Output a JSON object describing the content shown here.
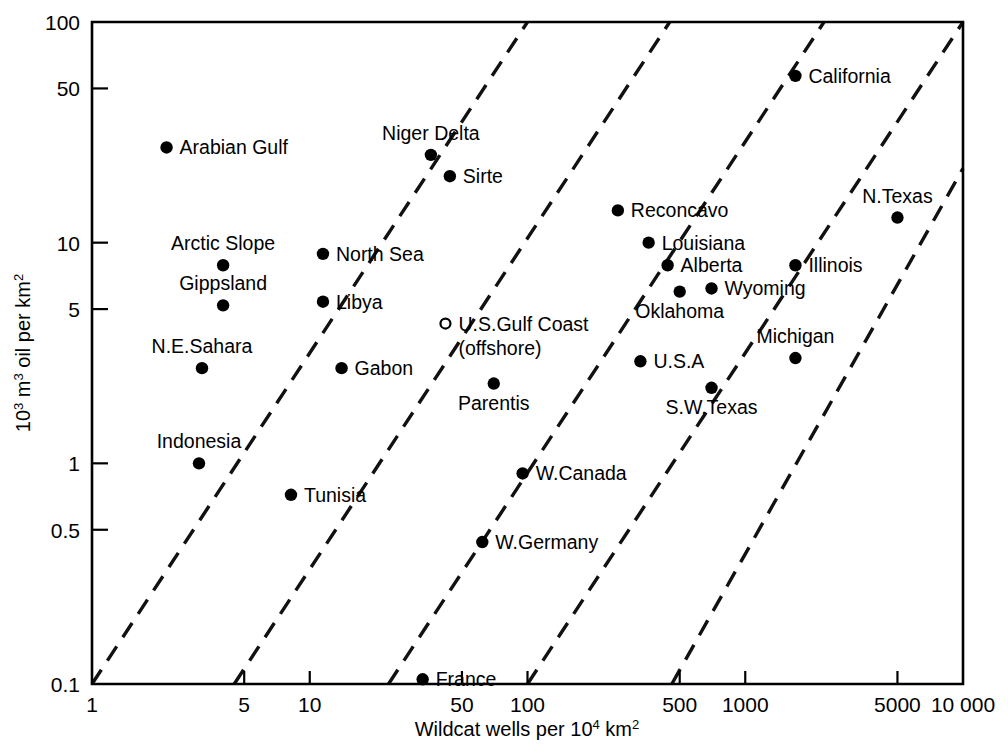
{
  "chart_data": {
    "type": "scatter",
    "title": "",
    "xlabel": "Wildcat wells per 10⁴ km²",
    "ylabel": "10³ m³ oil per km²",
    "xlabel_parts": {
      "pre": "Wildcat wells per 10",
      "exp": "4",
      "post": " km",
      "exp2": "2"
    },
    "ylabel_parts": {
      "pre": "10",
      "exp": "3",
      "mid": " m",
      "exp2": "3",
      "post": " oil per km",
      "exp3": "2"
    },
    "xscale": "log",
    "yscale": "log",
    "xlim": [
      1,
      10000
    ],
    "ylim": [
      0.1,
      100
    ],
    "grid": false,
    "legend": "none",
    "xticks": [
      1,
      5,
      10,
      50,
      100,
      500,
      1000,
      5000,
      10000
    ],
    "xticklabels": [
      "1",
      "5",
      "10",
      "50",
      "100",
      "500",
      "1000",
      "5000",
      "10 000"
    ],
    "yticks": [
      0.1,
      0.5,
      1,
      5,
      10,
      50,
      100
    ],
    "yticklabels": [
      "0.1",
      "0.5",
      "1",
      "5",
      "10",
      "50",
      "100"
    ],
    "annotation_lines": [
      {
        "name": "iso-yield-line-1",
        "x0": 1,
        "y0": 0.1,
        "x1": 100,
        "y1": 100
      },
      {
        "name": "iso-yield-line-2",
        "x0": 4.5,
        "y0": 0.1,
        "x1": 450,
        "y1": 100
      },
      {
        "name": "iso-yield-line-3",
        "x0": 23,
        "y0": 0.1,
        "x1": 2300,
        "y1": 100
      },
      {
        "name": "iso-yield-line-4",
        "x0": 100,
        "y0": 0.1,
        "x1": 10000,
        "y1": 100
      },
      {
        "name": "iso-yield-line-5",
        "x0": 460,
        "y0": 0.1,
        "x1": 10000,
        "y1": 21.7
      }
    ],
    "points": [
      {
        "label": "Arabian Gulf",
        "x": 2.2,
        "y": 27.0,
        "marker": "filled",
        "label_pos": "right"
      },
      {
        "label": "Arctic Slope",
        "x": 4.0,
        "y": 7.9,
        "marker": "filled",
        "label_pos": "above"
      },
      {
        "label": "Gippsland",
        "x": 4.0,
        "y": 5.2,
        "marker": "filled",
        "label_pos": "above"
      },
      {
        "label": "N.E.Sahara",
        "x": 3.2,
        "y": 2.7,
        "marker": "filled",
        "label_pos": "above"
      },
      {
        "label": "Indonesia",
        "x": 3.1,
        "y": 1.0,
        "marker": "filled",
        "label_pos": "above"
      },
      {
        "label": "North Sea",
        "x": 11.5,
        "y": 8.9,
        "marker": "filled",
        "label_pos": "right"
      },
      {
        "label": "Libya",
        "x": 11.5,
        "y": 5.4,
        "marker": "filled",
        "label_pos": "right"
      },
      {
        "label": "Gabon",
        "x": 14.0,
        "y": 2.7,
        "marker": "filled",
        "label_pos": "right"
      },
      {
        "label": "Tunisia",
        "x": 8.2,
        "y": 0.72,
        "marker": "filled",
        "label_pos": "right"
      },
      {
        "label": "Niger Delta",
        "x": 36.0,
        "y": 25.0,
        "marker": "filled",
        "label_pos": "above"
      },
      {
        "label": "Sirte",
        "x": 44.0,
        "y": 20.0,
        "marker": "filled",
        "label_pos": "right"
      },
      {
        "label": "U.S.Gulf Coast",
        "x": 42.0,
        "y": 4.3,
        "marker": "open",
        "label_pos": "right",
        "label2": "(offshore)"
      },
      {
        "label": "Parentis",
        "x": 70.0,
        "y": 2.3,
        "marker": "filled",
        "label_pos": "below"
      },
      {
        "label": "W.Canada",
        "x": 95.0,
        "y": 0.9,
        "marker": "filled",
        "label_pos": "right"
      },
      {
        "label": "W.Germany",
        "x": 62.0,
        "y": 0.44,
        "marker": "filled",
        "label_pos": "right"
      },
      {
        "label": "France",
        "x": 33.0,
        "y": 0.105,
        "marker": "filled",
        "label_pos": "right"
      },
      {
        "label": "Reconcavo",
        "x": 260.0,
        "y": 14.0,
        "marker": "filled",
        "label_pos": "right"
      },
      {
        "label": "Louisiana",
        "x": 360.0,
        "y": 10.0,
        "marker": "filled",
        "label_pos": "right"
      },
      {
        "label": "Alberta",
        "x": 440.0,
        "y": 7.9,
        "marker": "filled",
        "label_pos": "right"
      },
      {
        "label": "Oklahoma",
        "x": 500.0,
        "y": 6.0,
        "marker": "filled",
        "label_pos": "below"
      },
      {
        "label": "Wyoming",
        "x": 700.0,
        "y": 6.2,
        "marker": "filled",
        "label_pos": "right"
      },
      {
        "label": "U.S.A",
        "x": 330.0,
        "y": 2.9,
        "marker": "filled",
        "label_pos": "right"
      },
      {
        "label": "S.W.Texas",
        "x": 700.0,
        "y": 2.2,
        "marker": "filled",
        "label_pos": "below"
      },
      {
        "label": "California",
        "x": 1700.0,
        "y": 57.0,
        "marker": "filled",
        "label_pos": "right"
      },
      {
        "label": "N.Texas",
        "x": 5000.0,
        "y": 13.0,
        "marker": "filled",
        "label_pos": "above"
      },
      {
        "label": "Illinois",
        "x": 1700.0,
        "y": 7.9,
        "marker": "filled",
        "label_pos": "right"
      },
      {
        "label": "Michigan",
        "x": 1700.0,
        "y": 3.0,
        "marker": "filled",
        "label_pos": "above"
      }
    ]
  }
}
